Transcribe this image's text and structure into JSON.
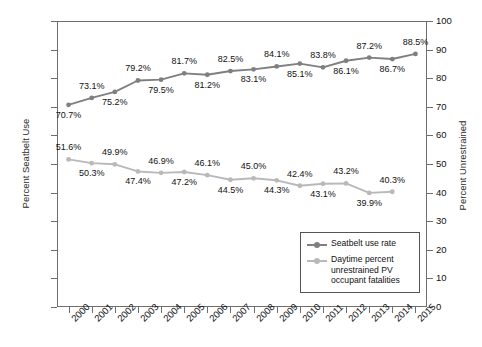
{
  "chart_data": {
    "type": "line",
    "title": "",
    "xlabel": "",
    "ylabel": "Percent Seatbelt Use",
    "y2label": "Percent Unrestrained",
    "categories": [
      "2000",
      "2001",
      "2002",
      "2003",
      "2004",
      "2005",
      "2006",
      "2007",
      "2008",
      "2009",
      "2010",
      "2011",
      "2012",
      "2013",
      "2014",
      "2015"
    ],
    "ylim": [
      0,
      100
    ],
    "y2lim": [
      0,
      100
    ],
    "yticks": [
      0,
      10,
      20,
      30,
      40,
      50,
      60,
      70,
      80,
      90,
      100
    ],
    "y2ticks": [
      0,
      10,
      20,
      30,
      40,
      50,
      60,
      70,
      80,
      90,
      100
    ],
    "grid": false,
    "legend_position": "inside-lower-right",
    "series": [
      {
        "name": "Seatbelt use rate",
        "color": "#7f7f7f",
        "axis": "left",
        "values": [
          70.7,
          73.1,
          75.2,
          79.2,
          79.5,
          81.7,
          81.2,
          82.5,
          83.1,
          84.1,
          85.1,
          83.8,
          86.1,
          87.2,
          86.7,
          88.5
        ],
        "labels": [
          "70.7%",
          "73.1%",
          "75.2%",
          "79.2%",
          "79.5%",
          "81.7%",
          "81.2%",
          "82.5%",
          "83.1%",
          "84.1%",
          "85.1%",
          "83.8%",
          "86.1%",
          "87.2%",
          "86.7%",
          "88.5%"
        ],
        "label_positions": [
          "below",
          "above",
          "below",
          "above",
          "below",
          "above",
          "below",
          "above",
          "below",
          "above",
          "below",
          "above",
          "below",
          "above",
          "below",
          "above"
        ]
      },
      {
        "name": "Daytime percent unrestrained PV occupant fatalities",
        "color": "#b9b9b9",
        "axis": "right",
        "values": [
          51.6,
          50.3,
          49.9,
          47.4,
          46.9,
          47.2,
          46.1,
          44.5,
          45.0,
          44.3,
          42.4,
          43.1,
          43.2,
          39.9,
          40.3,
          null
        ],
        "labels": [
          "51.6%",
          "50.3%",
          "49.9%",
          "47.4%",
          "46.9%",
          "47.2%",
          "46.1%",
          "44.5%",
          "45.0%",
          "44.3%",
          "42.4%",
          "43.1%",
          "43.2%",
          "39.9%",
          "40.3%",
          ""
        ],
        "label_positions": [
          "above",
          "below",
          "above",
          "below",
          "above",
          "below",
          "above",
          "below",
          "above",
          "below",
          "above",
          "below",
          "above",
          "below",
          "above",
          "above"
        ]
      }
    ],
    "legend": [
      {
        "label": "Seatbelt use rate",
        "color": "#7f7f7f"
      },
      {
        "label": "Daytime percent unrestrained PV occupant fatalities",
        "color": "#b9b9b9"
      }
    ]
  }
}
